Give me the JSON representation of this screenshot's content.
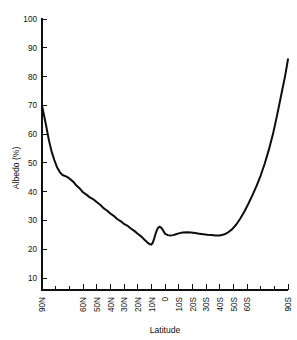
{
  "chart_data": {
    "type": "line",
    "title": "",
    "xlabel": "Latitude",
    "ylabel": "Albedo (%)",
    "ylim": [
      0,
      100
    ],
    "yticks": [
      10,
      20,
      30,
      40,
      50,
      60,
      70,
      80,
      90,
      100
    ],
    "ytick_labels": [
      "10",
      "20",
      "30",
      "40",
      "50",
      "60",
      "70",
      "80",
      "90",
      "100"
    ],
    "grid": false,
    "legend": "none",
    "xlim_deg": [
      90,
      -90
    ],
    "xticks_deg": [
      90,
      80,
      70,
      60,
      50,
      40,
      30,
      20,
      10,
      0,
      -10,
      -20,
      -30,
      -40,
      -50,
      -60,
      -70,
      -80,
      -90
    ],
    "xtick_labels": [
      "90N",
      "",
      "",
      "60N",
      "50N",
      "40N",
      "30N",
      "20N",
      "10N",
      "0",
      "10S",
      "20S",
      "30S",
      "40S",
      "50S",
      "60S",
      "",
      "",
      "90S"
    ],
    "series": [
      {
        "name": "Albedo",
        "x": [
          90,
          87,
          85,
          83,
          81,
          79,
          77,
          75,
          72,
          70,
          67,
          65,
          62,
          60,
          57,
          55,
          52,
          50,
          47,
          45,
          42,
          40,
          37,
          35,
          32,
          30,
          27,
          25,
          22,
          20,
          17,
          15,
          13,
          11,
          10,
          9,
          8,
          7,
          6,
          5,
          4,
          3,
          2,
          1,
          0,
          -2,
          -4,
          -6,
          -8,
          -10,
          -13,
          -16,
          -19,
          -22,
          -25,
          -28,
          -31,
          -34,
          -37,
          -40,
          -43,
          -46,
          -49,
          -52,
          -55,
          -58,
          -61,
          -64,
          -67,
          -70,
          -73,
          -76,
          -79,
          -82,
          -85,
          -88,
          -90
        ],
        "y": [
          70.0,
          63.0,
          58.0,
          54.0,
          51.0,
          48.5,
          46.8,
          45.8,
          45.2,
          44.6,
          43.4,
          42.2,
          40.9,
          39.8,
          38.8,
          38.0,
          37.2,
          36.4,
          35.3,
          34.3,
          33.3,
          32.4,
          31.4,
          30.5,
          29.6,
          28.8,
          28.0,
          27.2,
          26.2,
          25.4,
          24.3,
          23.3,
          22.4,
          21.7,
          21.6,
          22.2,
          23.6,
          25.2,
          26.6,
          27.5,
          27.8,
          27.6,
          27.0,
          26.2,
          25.4,
          24.9,
          24.8,
          24.9,
          25.2,
          25.5,
          25.8,
          25.9,
          25.8,
          25.6,
          25.4,
          25.2,
          25.0,
          24.9,
          24.8,
          24.8,
          25.1,
          25.8,
          26.9,
          28.5,
          30.6,
          33.0,
          35.8,
          38.8,
          42.0,
          45.6,
          49.8,
          54.6,
          60.0,
          66.5,
          73.5,
          80.5,
          86.0
        ]
      }
    ]
  }
}
